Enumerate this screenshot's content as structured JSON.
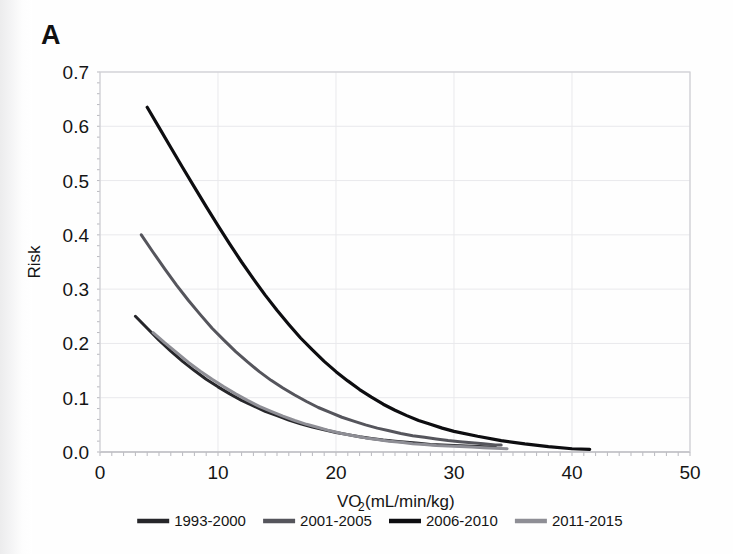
{
  "panel": {
    "label": "A"
  },
  "chart_data": {
    "type": "line",
    "title": "",
    "xlabel": "VO2 (mL/min/kg)",
    "xlabel_main": "VO",
    "xlabel_sub": "2",
    "xlabel_rest": " (mL/min/kg)",
    "ylabel": "Risk",
    "xlim": [
      0,
      50
    ],
    "ylim": [
      0.0,
      0.7
    ],
    "xticks": [
      0,
      10,
      20,
      30,
      40,
      50
    ],
    "xtick_labels": [
      "0",
      "10",
      "20",
      "30",
      "40",
      "50"
    ],
    "yticks": [
      0.0,
      0.1,
      0.2,
      0.3,
      0.4,
      0.5,
      0.6,
      0.7
    ],
    "ytick_labels": [
      "0.0",
      "0.1",
      "0.2",
      "0.3",
      "0.4",
      "0.5",
      "0.6",
      "0.7"
    ],
    "grid": true,
    "legend_position": "bottom",
    "series": [
      {
        "name": "1993-2000",
        "color": "#26262a",
        "width": 3.0,
        "x": [
          3.0,
          4.0,
          5.0,
          6.0,
          7.0,
          8.0,
          9.0,
          10.0,
          11.0,
          12.0,
          13.0,
          14.0,
          15.0,
          16.0,
          17.0,
          18.0,
          19.0,
          20.0,
          21.0,
          22.0,
          23.0,
          24.0,
          25.0,
          26.0,
          27.0,
          28.0,
          29.0,
          30.0,
          31.0,
          32.0,
          33.0,
          33.5
        ],
        "y": [
          0.25,
          0.228,
          0.206,
          0.186,
          0.167,
          0.15,
          0.134,
          0.12,
          0.107,
          0.095,
          0.085,
          0.075,
          0.067,
          0.059,
          0.052,
          0.046,
          0.041,
          0.036,
          0.032,
          0.028,
          0.025,
          0.022,
          0.02,
          0.018,
          0.016,
          0.014,
          0.013,
          0.012,
          0.011,
          0.01,
          0.009,
          0.009
        ]
      },
      {
        "name": "2001-2005",
        "color": "#55555c",
        "width": 3.0,
        "x": [
          3.5,
          4.5,
          5.5,
          6.5,
          7.5,
          8.5,
          9.5,
          10.5,
          11.5,
          12.5,
          13.5,
          14.5,
          15.5,
          16.5,
          17.5,
          18.5,
          19.5,
          20.5,
          21.5,
          22.5,
          23.5,
          24.5,
          25.5,
          26.5,
          27.5,
          28.5,
          29.5,
          30.5,
          31.5,
          32.5,
          33.5,
          34.0
        ],
        "y": [
          0.4,
          0.368,
          0.337,
          0.307,
          0.279,
          0.253,
          0.228,
          0.206,
          0.185,
          0.166,
          0.148,
          0.132,
          0.118,
          0.105,
          0.093,
          0.082,
          0.073,
          0.064,
          0.057,
          0.05,
          0.044,
          0.039,
          0.034,
          0.03,
          0.027,
          0.024,
          0.021,
          0.019,
          0.017,
          0.015,
          0.013,
          0.013
        ]
      },
      {
        "name": "2006-2010",
        "color": "#0d0d10",
        "width": 3.2,
        "x": [
          4.0,
          5.0,
          6.0,
          7.0,
          8.0,
          9.0,
          10.0,
          11.0,
          12.0,
          13.0,
          14.0,
          15.0,
          16.0,
          17.0,
          18.0,
          19.0,
          20.0,
          21.0,
          22.0,
          23.0,
          24.0,
          25.0,
          26.0,
          27.0,
          28.0,
          29.0,
          30.0,
          32.0,
          34.0,
          36.0,
          38.0,
          40.0,
          41.5
        ],
        "y": [
          0.635,
          0.598,
          0.561,
          0.524,
          0.488,
          0.452,
          0.417,
          0.383,
          0.35,
          0.319,
          0.289,
          0.261,
          0.235,
          0.21,
          0.188,
          0.167,
          0.148,
          0.131,
          0.115,
          0.101,
          0.088,
          0.077,
          0.067,
          0.058,
          0.051,
          0.044,
          0.038,
          0.029,
          0.021,
          0.015,
          0.01,
          0.006,
          0.005
        ]
      },
      {
        "name": "2011-2015",
        "color": "#8e8e95",
        "width": 3.0,
        "x": [
          4.5,
          5.5,
          6.5,
          7.5,
          8.5,
          9.5,
          10.5,
          11.5,
          12.5,
          13.5,
          14.5,
          15.5,
          16.5,
          17.5,
          18.5,
          19.5,
          20.5,
          21.5,
          22.5,
          23.5,
          24.5,
          25.5,
          26.5,
          27.5,
          28.5,
          29.5,
          30.5,
          31.5,
          32.5,
          33.5,
          34.5
        ],
        "y": [
          0.22,
          0.201,
          0.183,
          0.165,
          0.149,
          0.134,
          0.12,
          0.107,
          0.095,
          0.084,
          0.075,
          0.066,
          0.058,
          0.051,
          0.045,
          0.039,
          0.034,
          0.03,
          0.026,
          0.023,
          0.02,
          0.018,
          0.015,
          0.014,
          0.012,
          0.011,
          0.01,
          0.009,
          0.008,
          0.007,
          0.006
        ]
      }
    ]
  },
  "legend": {
    "items": [
      {
        "label": "1993-2000",
        "color": "#26262a"
      },
      {
        "label": "2001-2005",
        "color": "#55555c"
      },
      {
        "label": "2006-2010",
        "color": "#0d0d10"
      },
      {
        "label": "2011-2015",
        "color": "#8e8e95"
      }
    ]
  }
}
